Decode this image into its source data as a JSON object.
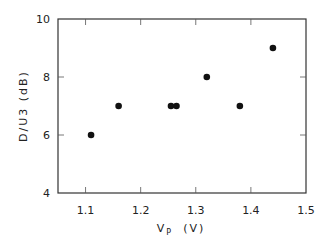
{
  "chart_data": {
    "type": "scatter",
    "title": "",
    "xlabel": "V_P (V)",
    "xlabel_main": "V",
    "xlabel_sub": "P",
    "xlabel_unit": "(V)",
    "ylabel": "D/U3 (dB)",
    "xlim": [
      1.05,
      1.5
    ],
    "ylim": [
      4,
      10
    ],
    "xticks": [
      1.1,
      1.2,
      1.3,
      1.4,
      1.5
    ],
    "xtick_labels": [
      "1.1",
      "1.2",
      "1.3",
      "1.4",
      "1.5"
    ],
    "yticks": [
      4,
      6,
      8,
      10
    ],
    "ytick_labels": [
      "4",
      "6",
      "8",
      "10"
    ],
    "grid": false,
    "legend": null,
    "series": [
      {
        "name": "D/U3",
        "x": [
          1.11,
          1.16,
          1.255,
          1.265,
          1.32,
          1.38,
          1.44
        ],
        "y": [
          6,
          7,
          7,
          7,
          8,
          7,
          9
        ]
      }
    ]
  },
  "colors": {
    "axis": "#333333",
    "marker": "#111111"
  }
}
